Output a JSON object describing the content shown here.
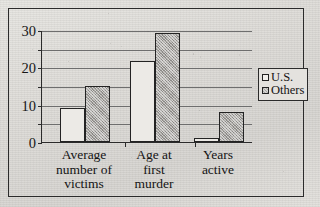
{
  "chart_data": {
    "type": "bar",
    "title": "",
    "subtitle": "",
    "xlabel": "",
    "ylabel": "",
    "ylim": [
      0,
      30
    ],
    "y_ticks": [
      0,
      5,
      10,
      15,
      20,
      25,
      30
    ],
    "y_tick_labels": [
      "0",
      "",
      "10",
      "",
      "20",
      "",
      "30"
    ],
    "grid": "horizontal",
    "legend_position": "right-outside",
    "categories": [
      "Average number of victims",
      "Age at first murder",
      "Years active"
    ],
    "category_lines": [
      [
        "Average",
        "number of",
        "victims"
      ],
      [
        "Age at",
        "first",
        "murder"
      ],
      [
        "Years",
        "active"
      ]
    ],
    "series": [
      {
        "name": "U.S.",
        "values": [
          9,
          21.7,
          1
        ],
        "fill": "#eceae6",
        "stroke": "#232323"
      },
      {
        "name": "Others",
        "values": [
          15,
          29.2,
          8
        ],
        "fill": "#a9a7a3",
        "stroke": "#232323"
      }
    ]
  },
  "axis": {
    "labels": [
      {
        "value": 30,
        "text": "30"
      },
      {
        "value": 20,
        "text": "20"
      },
      {
        "value": 10,
        "text": "10"
      },
      {
        "value": 0,
        "text": "0"
      }
    ],
    "minor_values": [
      25,
      15,
      5
    ]
  },
  "legend": {
    "items": [
      {
        "label": "U.S.",
        "swatch": "legend-swatch-us"
      },
      {
        "label": "Others",
        "swatch": "legend-swatch-others"
      }
    ]
  },
  "colors": {
    "paper": "#ded c d8",
    "ink": "#232323",
    "grid": "#6e6e6e",
    "series_us": "#eceae6",
    "series_others": "#a9a7a3"
  }
}
